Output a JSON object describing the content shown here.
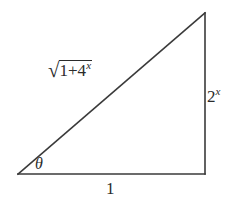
{
  "figure": {
    "background_color": "#ffffff",
    "stroke_color": "#3a3a3a",
    "text_color": "#2b2b2b"
  },
  "labels": {
    "hypotenuse": {
      "radical_sign": "√",
      "radicand_base": "1+4",
      "radicand_exponent": "x",
      "full_text": "√(1+4^x)"
    },
    "vertical_leg": {
      "base": "2",
      "exponent": "x",
      "full_text": "2^x"
    },
    "base_leg": {
      "text": "1"
    },
    "angle": {
      "text": "θ"
    }
  },
  "geometry": {
    "vertices": {
      "bottom_left": [
        18,
        174
      ],
      "bottom_right": [
        205,
        174
      ],
      "apex": [
        205,
        13
      ]
    }
  }
}
